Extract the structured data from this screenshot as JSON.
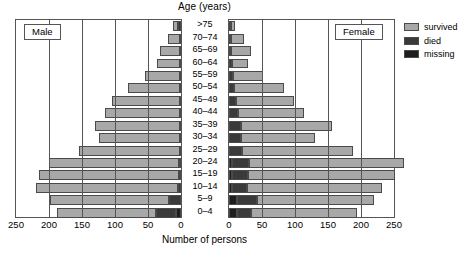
{
  "chart_data": {
    "type": "bar",
    "subtype": "population-pyramid",
    "title": "Age (years)",
    "xlabel": "Number of persons",
    "ylabel": "Age (years)",
    "xlim": [
      0,
      250
    ],
    "xticks": [
      0,
      50,
      100,
      150,
      200,
      250
    ],
    "grid": true,
    "legend_position": "right",
    "categories": [
      ">75",
      "70–74",
      "65–69",
      "60–64",
      "55–59",
      "50–54",
      "45–49",
      "40–44",
      "35–39",
      "30–34",
      "25–29",
      "20–24",
      "15–19",
      "10–14",
      "5–9",
      "0–4"
    ],
    "panels": [
      {
        "name": "Male",
        "direction": "left",
        "series": [
          {
            "name": "survived",
            "color": "#a8a8a8",
            "values": [
              8,
              18,
              30,
              35,
              52,
              78,
              103,
              113,
              128,
              122,
              152,
              197,
              212,
              215,
              180,
              150
            ]
          },
          {
            "name": "died",
            "color": "#3a3a3a",
            "values": [
              4,
              2,
              2,
              2,
              2,
              2,
              2,
              2,
              2,
              2,
              2,
              3,
              3,
              4,
              18,
              30
            ]
          },
          {
            "name": "missing",
            "color": "#1d1d1d",
            "values": [
              0,
              0,
              0,
              0,
              0,
              0,
              0,
              0,
              0,
              0,
              0,
              0,
              0,
              0,
              0,
              8
            ]
          }
        ],
        "totals": [
          12,
          20,
          32,
          37,
          54,
          80,
          105,
          115,
          130,
          124,
          154,
          200,
          215,
          219,
          198,
          188
        ]
      },
      {
        "name": "Female",
        "direction": "right",
        "series": [
          {
            "name": "survived",
            "color": "#a8a8a8",
            "values": [
              6,
              20,
              30,
              25,
              45,
              75,
              88,
              100,
              138,
              112,
              168,
              235,
              222,
              205,
              178,
              160
            ]
          },
          {
            "name": "died",
            "color": "#3a3a3a",
            "values": [
              3,
              3,
              3,
              4,
              6,
              8,
              10,
              14,
              18,
              18,
              20,
              25,
              24,
              22,
              30,
              22
            ]
          },
          {
            "name": "missing",
            "color": "#1d1d1d",
            "values": [
              0,
              0,
              0,
              0,
              0,
              0,
              0,
              0,
              0,
              0,
              0,
              5,
              5,
              5,
              12,
              12
            ]
          }
        ],
        "totals": [
          9,
          23,
          33,
          29,
          51,
          83,
          98,
          114,
          156,
          130,
          188,
          235,
          222,
          205,
          178,
          160
        ]
      }
    ],
    "male_axis_ticks": [
      "250",
      "200",
      "150",
      "100",
      "50",
      "0"
    ],
    "female_axis_ticks": [
      "0",
      "50",
      "100",
      "150",
      "200",
      "250"
    ]
  },
  "legend": {
    "items": [
      {
        "label": "survived",
        "key": "survived"
      },
      {
        "label": "died",
        "key": "died"
      },
      {
        "label": "missing",
        "key": "missing"
      }
    ]
  },
  "labels": {
    "male_box": "Male",
    "female_box": "Female"
  }
}
